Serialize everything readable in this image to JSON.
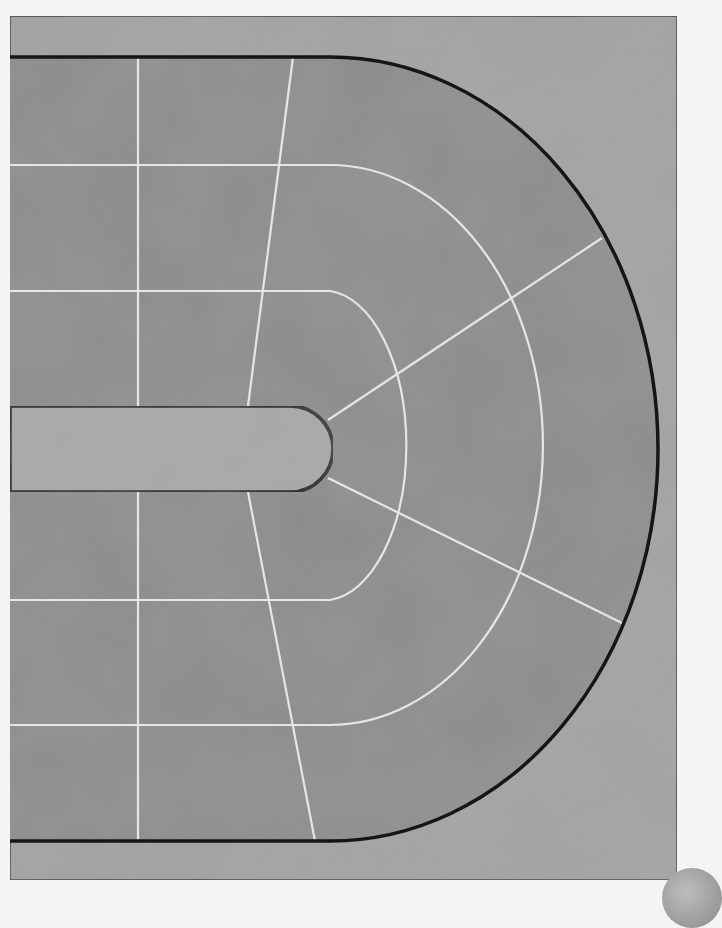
{
  "board": {
    "title": "Race track board - curve segment",
    "colors": {
      "page_background": "#f4f4f4",
      "frame_fill": "#a3a3a3",
      "frame_border": "#3a3a3a",
      "track_fill": "#8c8c8c",
      "track_border": "#151515",
      "lane_line": "#e6e6e6",
      "infield_fill": "#a8a8a8"
    },
    "frame": {
      "x": 10,
      "y": 16,
      "width": 667,
      "height": 864
    },
    "track_outer": {
      "top_y": 57,
      "bottom_y": 841,
      "arc_start_x": 330,
      "arc_rx": 328,
      "arc_ry": 392,
      "center_y": 449
    },
    "infield": {
      "top_y": 406,
      "bottom_y": 492,
      "end_x": 290,
      "cap_radius": 43
    },
    "lanes": [
      {
        "name": "inner",
        "top_y": 291,
        "bottom_y": 600,
        "arc_start_x": 330,
        "rx": 83,
        "ry": 155
      },
      {
        "name": "middle",
        "top_y": 165,
        "bottom_y": 725,
        "arc_start_x": 330,
        "rx": 213,
        "ry": 280
      }
    ],
    "straight_dividers": [
      {
        "x1": 138,
        "y1": 57,
        "x2": 138,
        "y2": 841
      }
    ],
    "sector_lines": [
      {
        "x1": 293,
        "y1": 57,
        "x2": 248,
        "y2": 406
      },
      {
        "x1": 248,
        "y1": 492,
        "x2": 315,
        "y2": 841
      },
      {
        "x1": 328,
        "y1": 420,
        "x2": 602,
        "y2": 238
      },
      {
        "x1": 328,
        "y1": 478,
        "x2": 624,
        "y2": 624
      }
    ],
    "spaces_visible": 0
  }
}
